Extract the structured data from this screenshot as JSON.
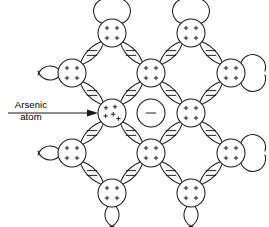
{
  "figure": {
    "name": "arsenic-doped-semiconductor-lattice",
    "background_color": "#ffffff",
    "line_color": "#1a1a1a"
  },
  "callout": {
    "label_line1": "Arsenic",
    "label_line2": "atom",
    "arrow_direction": "right",
    "points_to": "arsenic-atom"
  },
  "legend_symbols": {
    "host_atom_core": "+",
    "host_atom_core_count": 4,
    "dopant_atom_core": "+",
    "dopant_atom_core_count": 5,
    "bond_electron_pair": "=",
    "free_electron": "-"
  },
  "lattice": {
    "rows": 5,
    "columns": 5,
    "atom_count": 13,
    "bond_count": 16,
    "free_electron_count": 1,
    "atoms": [
      {
        "id": "a-r0-c1",
        "label": "host-atom",
        "charges": 4,
        "row": 0,
        "col": 1,
        "cx": 112,
        "cy": 33,
        "r": 14,
        "edge_stubs": "top"
      },
      {
        "id": "a-r0-c3",
        "label": "host-atom",
        "charges": 4,
        "row": 0,
        "col": 3,
        "cx": 191,
        "cy": 33,
        "r": 14,
        "edge_stubs": "top"
      },
      {
        "id": "a-r1-c0",
        "label": "host-atom",
        "charges": 4,
        "row": 1,
        "col": 0,
        "cx": 72,
        "cy": 73,
        "r": 14,
        "edge_stubs": "left"
      },
      {
        "id": "a-r1-c2",
        "label": "host-atom",
        "charges": 4,
        "row": 1,
        "col": 2,
        "cx": 151,
        "cy": 73,
        "r": 14,
        "edge_stubs": "none"
      },
      {
        "id": "a-r1-c4",
        "label": "host-atom",
        "charges": 4,
        "row": 1,
        "col": 4,
        "cx": 231,
        "cy": 73,
        "r": 14,
        "edge_stubs": "right"
      },
      {
        "id": "a-r2-c1",
        "label": "arsenic-atom",
        "charges": 5,
        "row": 2,
        "col": 1,
        "cx": 112,
        "cy": 113,
        "r": 14,
        "edge_stubs": "none"
      },
      {
        "id": "a-r2-c3",
        "label": "host-atom",
        "charges": 4,
        "row": 2,
        "col": 3,
        "cx": 191,
        "cy": 113,
        "r": 14,
        "edge_stubs": "none"
      },
      {
        "id": "a-r3-c0",
        "label": "host-atom",
        "charges": 4,
        "row": 3,
        "col": 0,
        "cx": 72,
        "cy": 153,
        "r": 14,
        "edge_stubs": "left"
      },
      {
        "id": "a-r3-c2",
        "label": "host-atom",
        "charges": 4,
        "row": 3,
        "col": 2,
        "cx": 151,
        "cy": 153,
        "r": 14,
        "edge_stubs": "none"
      },
      {
        "id": "a-r3-c4",
        "label": "host-atom",
        "charges": 4,
        "row": 3,
        "col": 4,
        "cx": 231,
        "cy": 153,
        "r": 14,
        "edge_stubs": "right"
      },
      {
        "id": "a-r4-c1",
        "label": "host-atom",
        "charges": 4,
        "row": 4,
        "col": 1,
        "cx": 112,
        "cy": 193,
        "r": 14,
        "edge_stubs": "bottom"
      },
      {
        "id": "a-r4-c3",
        "label": "host-atom",
        "charges": 4,
        "row": 4,
        "col": 3,
        "cx": 191,
        "cy": 193,
        "r": 14,
        "edge_stubs": "bottom"
      }
    ],
    "bonds": [
      {
        "id": "b-1",
        "from": "a-r0-c1",
        "to": "a-r1-c0",
        "symbol": "=",
        "cx": 92,
        "cy": 53
      },
      {
        "id": "b-2",
        "from": "a-r0-c1",
        "to": "a-r1-c2",
        "symbol": "=",
        "cx": 131,
        "cy": 53
      },
      {
        "id": "b-3",
        "from": "a-r0-c3",
        "to": "a-r1-c2",
        "symbol": "=",
        "cx": 171,
        "cy": 53
      },
      {
        "id": "b-4",
        "from": "a-r0-c3",
        "to": "a-r1-c4",
        "symbol": "=",
        "cx": 211,
        "cy": 53
      },
      {
        "id": "b-5",
        "from": "a-r1-c0",
        "to": "a-r2-c1",
        "symbol": "=",
        "cx": 92,
        "cy": 93
      },
      {
        "id": "b-6",
        "from": "a-r1-c2",
        "to": "a-r2-c1",
        "symbol": "=",
        "cx": 131,
        "cy": 93
      },
      {
        "id": "b-7",
        "from": "a-r1-c2",
        "to": "a-r2-c3",
        "symbol": "=",
        "cx": 171,
        "cy": 93
      },
      {
        "id": "b-8",
        "from": "a-r1-c4",
        "to": "a-r2-c3",
        "symbol": "=",
        "cx": 211,
        "cy": 93
      },
      {
        "id": "b-9",
        "from": "a-r2-c1",
        "to": "a-r3-c0",
        "symbol": "=",
        "cx": 92,
        "cy": 133
      },
      {
        "id": "b-10",
        "from": "a-r2-c1",
        "to": "a-r3-c2",
        "symbol": "=",
        "cx": 131,
        "cy": 133
      },
      {
        "id": "b-11",
        "from": "a-r2-c3",
        "to": "a-r3-c2",
        "symbol": "=",
        "cx": 171,
        "cy": 133
      },
      {
        "id": "b-12",
        "from": "a-r2-c3",
        "to": "a-r3-c4",
        "symbol": "=",
        "cx": 211,
        "cy": 133
      },
      {
        "id": "b-13",
        "from": "a-r3-c0",
        "to": "a-r4-c1",
        "symbol": "=",
        "cx": 92,
        "cy": 173
      },
      {
        "id": "b-14",
        "from": "a-r3-c2",
        "to": "a-r4-c1",
        "symbol": "=",
        "cx": 131,
        "cy": 173
      },
      {
        "id": "b-15",
        "from": "a-r3-c2",
        "to": "a-r4-c3",
        "symbol": "=",
        "cx": 171,
        "cy": 173
      },
      {
        "id": "b-16",
        "from": "a-r3-c4",
        "to": "a-r4-c3",
        "symbol": "=",
        "cx": 211,
        "cy": 173
      }
    ],
    "free_electron": {
      "id": "free-electron",
      "symbol": "-",
      "cx": 151,
      "cy": 113,
      "r": 14
    }
  }
}
